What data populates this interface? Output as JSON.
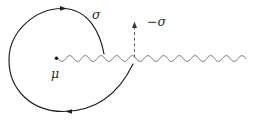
{
  "figure": {
    "kind": "complex-plane-contour-diagram",
    "labels": {
      "sigma": "σ",
      "minus_sigma": "−σ",
      "mu": "μ"
    },
    "elements": {
      "contour": "spiral contour around branch point, clockwise arrows",
      "branch_cut": "wavy line from branch point to right edge",
      "crossing_arrow": "dashed arrow pointing up through the cut"
    },
    "colors": {
      "contour": "#1e1e1e",
      "branch_cut": "#6f6f6f",
      "dashed_arrow": "#4a4a4a",
      "text": "#2b2b2b",
      "background": "#ffffff"
    }
  }
}
